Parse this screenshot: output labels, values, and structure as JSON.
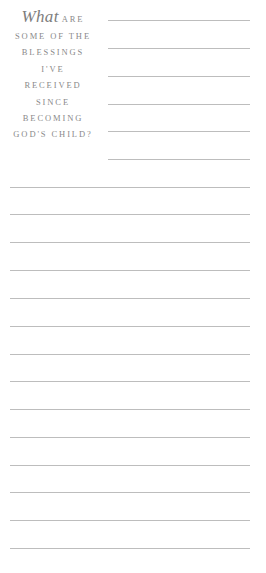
{
  "prompt": {
    "script_word": "What",
    "lines": [
      "ARE",
      "SOME OF THE",
      "BLESSINGS",
      "I'VE",
      "RECEIVED",
      "SINCE",
      "BECOMING",
      "GOD'S CHILD?"
    ]
  },
  "writing_lines": {
    "short_count": 6,
    "long_count": 14,
    "color": "#bdbdbd"
  }
}
